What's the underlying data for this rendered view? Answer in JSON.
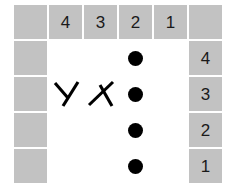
{
  "puzzle": {
    "title": "Logic grid puzzle",
    "columns": 6,
    "rows": 5,
    "colors": {
      "header_fill": "#c2c2c2",
      "cell_fill": "#ffffff",
      "mark_color": "#000000",
      "page_background": "#ffffff"
    },
    "column_headers": [
      "",
      "4",
      "3",
      "2",
      "1",
      ""
    ],
    "row_headers": [
      "",
      "4",
      "3",
      "2",
      "1"
    ],
    "grid": [
      [
        {
          "kind": "header",
          "label": ""
        },
        {
          "kind": "header",
          "label": "4"
        },
        {
          "kind": "header",
          "label": "3"
        },
        {
          "kind": "header",
          "label": "2"
        },
        {
          "kind": "header",
          "label": "1"
        },
        {
          "kind": "header",
          "label": ""
        }
      ],
      [
        {
          "kind": "header",
          "label": ""
        },
        {
          "kind": "cell",
          "mark": ""
        },
        {
          "kind": "cell",
          "mark": ""
        },
        {
          "kind": "cell",
          "mark": "dot"
        },
        {
          "kind": "cell",
          "mark": ""
        },
        {
          "kind": "header",
          "label": "4"
        }
      ],
      [
        {
          "kind": "header",
          "label": ""
        },
        {
          "kind": "cell",
          "mark": "x-right"
        },
        {
          "kind": "cell",
          "mark": "x-left"
        },
        {
          "kind": "cell",
          "mark": "dot"
        },
        {
          "kind": "cell",
          "mark": ""
        },
        {
          "kind": "header",
          "label": "3"
        }
      ],
      [
        {
          "kind": "header",
          "label": ""
        },
        {
          "kind": "cell",
          "mark": ""
        },
        {
          "kind": "cell",
          "mark": ""
        },
        {
          "kind": "cell",
          "mark": "dot"
        },
        {
          "kind": "cell",
          "mark": ""
        },
        {
          "kind": "header",
          "label": "2"
        }
      ],
      [
        {
          "kind": "header",
          "label": ""
        },
        {
          "kind": "cell",
          "mark": ""
        },
        {
          "kind": "cell",
          "mark": ""
        },
        {
          "kind": "cell",
          "mark": "dot"
        },
        {
          "kind": "cell",
          "mark": ""
        },
        {
          "kind": "header",
          "label": "1"
        }
      ]
    ],
    "marks": {
      "dot_name": "filled-dot-icon",
      "x_name": "x-mark-icon"
    }
  }
}
